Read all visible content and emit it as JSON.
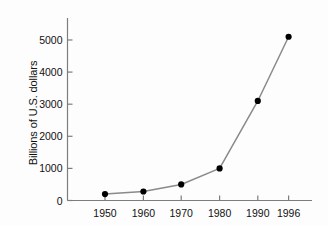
{
  "chart_data": {
    "type": "line",
    "title": "",
    "xlabel": "",
    "ylabel": "Billions of U.S. dollars",
    "categories": [
      "1950",
      "1960",
      "1970",
      "1980",
      "1990",
      "1996"
    ],
    "x": [
      1950,
      1960,
      1970,
      1980,
      1990,
      1996
    ],
    "values": [
      200,
      280,
      500,
      1000,
      3100,
      5100
    ],
    "series": [
      {
        "name": "U.S. dollars",
        "values": [
          200,
          280,
          500,
          1000,
          3100,
          5100
        ]
      }
    ],
    "xtick_labels": [
      "1950",
      "1960",
      "1970",
      "1980",
      "1990",
      "1996"
    ],
    "ytick_labels": [
      "0",
      "1000",
      "2000",
      "3000",
      "4000",
      "5000"
    ],
    "ytick_values": [
      0,
      1000,
      2000,
      3000,
      4000,
      5000
    ],
    "ylim": [
      0,
      5700
    ],
    "xlim": [
      1945,
      2001
    ],
    "grid": false,
    "legend": "none",
    "marker": "filled-circle",
    "line_color": "#8a8a8a",
    "marker_color": "#000000",
    "axis_color": "#7d7d7d",
    "background_color": "#fdfdfd"
  },
  "axis": {
    "y_title": "Billions of U.S. dollars",
    "y_ticks": [
      {
        "label": "5000",
        "value": 5000
      },
      {
        "label": "4000",
        "value": 4000
      },
      {
        "label": "3000",
        "value": 3000
      },
      {
        "label": "2000",
        "value": 2000
      },
      {
        "label": "1000",
        "value": 1000
      },
      {
        "label": "0",
        "value": 0
      }
    ],
    "x_ticks": [
      {
        "label": "1950",
        "value": 1950
      },
      {
        "label": "1960",
        "value": 1960
      },
      {
        "label": "1970",
        "value": 1970
      },
      {
        "label": "1980",
        "value": 1980
      },
      {
        "label": "1990",
        "value": 1990
      },
      {
        "label": "1996",
        "value": 1996
      }
    ]
  }
}
